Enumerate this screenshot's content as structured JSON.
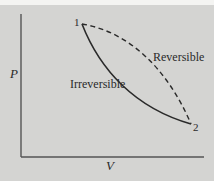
{
  "diagram": {
    "type": "PV diagram",
    "axes": {
      "x_label": "V",
      "y_label": "P"
    },
    "points": [
      {
        "id": "1",
        "label": "1"
      },
      {
        "id": "2",
        "label": "2"
      }
    ],
    "curves": [
      {
        "name": "reversible",
        "label": "Reversible",
        "style": "dashed",
        "from": "1",
        "to": "2"
      },
      {
        "name": "irreversible",
        "label": "Irreversible",
        "style": "solid",
        "from": "1",
        "to": "2"
      }
    ],
    "colors": {
      "background": "#d4d4d2",
      "ink": "#2a2a2a",
      "axis": "#555555"
    }
  }
}
